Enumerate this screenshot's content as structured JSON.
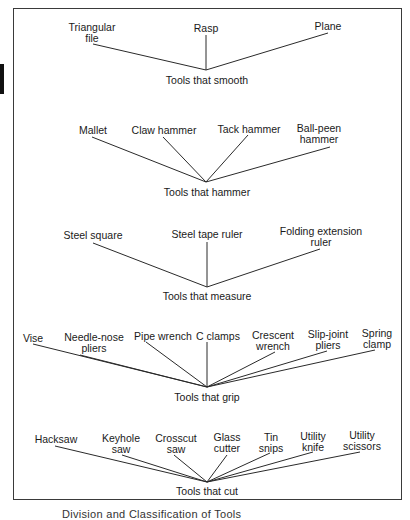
{
  "diagram": {
    "type": "classification-tree",
    "figure_caption": "Division and Classification of Tools",
    "groups": [
      {
        "id": "smooth",
        "caption": "Tools that smooth",
        "hub": [
          206,
          70
        ],
        "caption_pos": [
          207,
          75
        ],
        "items": [
          {
            "label": "Triangular\nfile",
            "pos": [
              92,
              22
            ],
            "line_from": [
              93,
              44
            ]
          },
          {
            "label": "Rasp",
            "pos": [
              206,
              23
            ],
            "line_from": [
              206,
              35
            ]
          },
          {
            "label": "Plane",
            "pos": [
              328,
              21
            ],
            "line_from": [
              328,
              33
            ]
          }
        ]
      },
      {
        "id": "hammer",
        "caption": "Tools that hammer",
        "hub": [
          206,
          182
        ],
        "caption_pos": [
          207,
          187
        ],
        "items": [
          {
            "label": "Mallet",
            "pos": [
              93,
              125
            ],
            "line_from": [
              92,
              137
            ]
          },
          {
            "label": "Claw hammer",
            "pos": [
              164,
              125
            ],
            "line_from": [
              163,
              137
            ]
          },
          {
            "label": "Tack hammer",
            "pos": [
              249,
              124
            ],
            "line_from": [
              248,
              135
            ]
          },
          {
            "label": "Ball-peen\nhammer",
            "pos": [
              319,
              123
            ],
            "line_from": [
              330,
              147
            ]
          }
        ]
      },
      {
        "id": "measure",
        "caption": "Tools that measure",
        "hub": [
          207,
          287
        ],
        "caption_pos": [
          207,
          291
        ],
        "items": [
          {
            "label": "Steel square",
            "pos": [
              93,
              230
            ],
            "line_from": [
              93,
              243
            ]
          },
          {
            "label": "Steel tape ruler",
            "pos": [
              207,
              229
            ],
            "line_from": [
              207,
              242
            ]
          },
          {
            "label": "Folding extension\nruler",
            "pos": [
              321,
              226
            ],
            "line_from": [
              320,
              249
            ]
          }
        ]
      },
      {
        "id": "grip",
        "caption": "Tools that grip",
        "hub": [
          207,
          387
        ],
        "caption_pos": [
          207,
          392
        ],
        "items": [
          {
            "label": "Vise",
            "pos": [
              33,
              333
            ],
            "line_from": [
              33,
              344
            ]
          },
          {
            "label": "Needle-nose\npliers",
            "pos": [
              94,
              332
            ],
            "line_from": [
              80,
              355
            ]
          },
          {
            "label": "Pipe wrench",
            "pos": [
              163,
              331
            ],
            "line_from": [
              146,
              342
            ]
          },
          {
            "label": "C clamps",
            "pos": [
              218,
              331
            ],
            "line_from": [
              207,
              342
            ]
          },
          {
            "label": "Crescent\nwrench",
            "pos": [
              273,
              330
            ],
            "line_from": [
              275,
              352
            ]
          },
          {
            "label": "Slip-joint\npliers",
            "pos": [
              328,
              329
            ],
            "line_from": [
              327,
              351
            ]
          },
          {
            "label": "Spring\nclamp",
            "pos": [
              377,
              328
            ],
            "line_from": [
              375,
              350
            ]
          }
        ]
      },
      {
        "id": "cut",
        "caption": "Tools that cut",
        "hub": [
          207,
          482
        ],
        "caption_pos": [
          207,
          486
        ],
        "items": [
          {
            "label": "Hacksaw",
            "pos": [
              56,
              434
            ],
            "line_from": [
              55,
              446
            ]
          },
          {
            "label": "Keyhole\nsaw",
            "pos": [
              121,
              433
            ],
            "line_from": [
              122,
              455
            ]
          },
          {
            "label": "Crosscut\nsaw",
            "pos": [
              176,
              433
            ],
            "line_from": [
              174,
              455
            ]
          },
          {
            "label": "Glass\ncutter",
            "pos": [
              227,
              432
            ],
            "line_from": [
              227,
              455
            ]
          },
          {
            "label": "Tin\nsnips",
            "pos": [
              271,
              432
            ],
            "line_from": [
              270,
              453
            ]
          },
          {
            "label": "Utility\nknife",
            "pos": [
              313,
              431
            ],
            "line_from": [
              313,
              452
            ]
          },
          {
            "label": "Utility\nscissors",
            "pos": [
              362,
              430
            ],
            "line_from": [
              360,
              452
            ]
          }
        ]
      }
    ]
  }
}
